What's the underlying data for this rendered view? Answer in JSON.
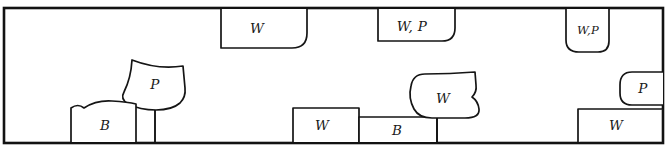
{
  "diagram": {
    "style": {
      "ink_color": "#151515",
      "frame_color": "#121212",
      "background_color": "#ffffff"
    },
    "frame": {
      "label": "outer-rectangle",
      "x": 4,
      "y": 8,
      "width": 659,
      "height": 135
    },
    "shapes": [
      {
        "id": "top-w-box",
        "label": "W",
        "kind": "box-hanging-from-top",
        "anchor": "top",
        "label_x": 257,
        "label_y": 29,
        "path": "M 221 9 L 221 48 L 292 48 Q 307 48 307 33 L 307 9"
      },
      {
        "id": "top-wp-box",
        "label": "W, P",
        "kind": "box-hanging-from-top",
        "anchor": "top",
        "label_x": 412,
        "label_y": 27,
        "path": "M 378 9 L 378 41 L 442 41 Q 455 41 455 28 L 455 9"
      },
      {
        "id": "top-right-wp-box",
        "label": "W,P",
        "kind": "box-hanging-from-top",
        "anchor": "top",
        "label_x": 588,
        "label_y": 31,
        "path": "M 566 9 L 566 40 Q 566 52 579 52 L 598 52 Q 609 52 609 41 L 609 9"
      },
      {
        "id": "left-p-blob",
        "label": "P",
        "kind": "blob-on-baseline",
        "anchor": "bottom-stem",
        "label_x": 155,
        "label_y": 85,
        "path": "M 132 60 Q 131 78 124 92 Q 120 99 128 104 Q 140 110 156 110 Q 172 110 180 103 Q 186 97 185 88 L 183 66 Q 158 70 132 60 Z",
        "stem": {
          "x": 155,
          "y1": 110,
          "y2": 142
        }
      },
      {
        "id": "left-b-box",
        "label": "B",
        "kind": "box-on-baseline",
        "anchor": "bottom",
        "label_x": 105,
        "label_y": 126,
        "path": "M 71 142 L 71 108 Q 78 103 84 108 Q 96 100 112 101 Q 128 102 136 104 L 136 142"
      },
      {
        "id": "mid-w-box",
        "label": "W",
        "kind": "box-on-baseline",
        "anchor": "bottom",
        "label_x": 322,
        "label_y": 126,
        "path": "M 293 142 L 293 108 L 359 108 L 359 142"
      },
      {
        "id": "mid-b-box",
        "label": "B",
        "kind": "box-on-baseline",
        "anchor": "bottom",
        "label_x": 397,
        "label_y": 131,
        "path": "M 359 142 L 359 117 L 437 117 L 437 142"
      },
      {
        "id": "mid-w-blob",
        "label": "W",
        "kind": "blob-on-baseline",
        "anchor": "bottom-stem",
        "label_x": 443,
        "label_y": 99,
        "path": "M 425 74 Q 413 74 411 86 Q 408 98 414 109 Q 419 118 432 118 L 465 118 Q 480 118 479 109 Q 478 101 472 97 Q 477 92 476 85 L 475 72 Q 450 74 425 74 Z",
        "stem": {
          "x": 437,
          "y1": 118,
          "y2": 142
        }
      },
      {
        "id": "right-p-box",
        "label": "P",
        "kind": "box-hanging-right",
        "anchor": "right",
        "label_x": 643,
        "label_y": 89,
        "path": "M 663 72 L 632 72 Q 620 72 620 85 L 620 93 Q 620 105 632 105 L 663 105"
      },
      {
        "id": "right-w-box",
        "label": "W",
        "kind": "box-on-baseline",
        "anchor": "bottom",
        "label_x": 616,
        "label_y": 126,
        "path": "M 578 142 L 578 109 L 663 109"
      }
    ]
  }
}
